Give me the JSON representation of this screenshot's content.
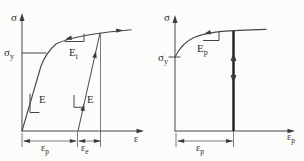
{
  "figure_title": "elastoplastic stress-strain diagrams",
  "colors": {
    "background": "#fcfcfa",
    "line": "#474747",
    "bold_line": "#1c1c1c",
    "text": "#2e2e2e"
  },
  "left": {
    "description": "stress versus total strain with elastic loading, hardening and elastic unloading",
    "sigma_axis": "σ",
    "eps_axis": "ε",
    "sigma_y": {
      "main": "σ",
      "sub": "y"
    },
    "E_loading": "E",
    "E_unloading": "E",
    "E_tangent": {
      "main": "E",
      "sub": "t"
    },
    "eps_plastic_dim": {
      "main": "ε",
      "sub": "p"
    },
    "eps_elastic_dim": {
      "main": "ε",
      "sub": "e"
    }
  },
  "right": {
    "description": "stress versus plastic strain with plastic hardening modulus",
    "sigma_axis": "σ",
    "eps_axis": {
      "main": "ε",
      "sub": "p"
    },
    "sigma_y": {
      "main": "σ",
      "sub": "y"
    },
    "E_plastic": {
      "main": "E",
      "sub": "p"
    },
    "eps_plastic_dim": {
      "main": "ε",
      "sub": "p"
    }
  }
}
